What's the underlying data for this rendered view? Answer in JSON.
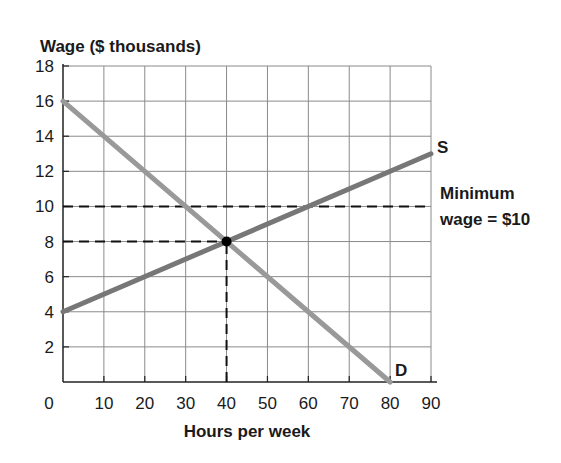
{
  "chart_data": {
    "type": "line",
    "title": "",
    "ylabel": "Wage ($ thousands)",
    "xlabel": "Hours per week",
    "xlim": [
      0,
      90
    ],
    "ylim": [
      0,
      18
    ],
    "x_ticks": [
      0,
      10,
      20,
      30,
      40,
      50,
      60,
      70,
      80,
      90
    ],
    "y_ticks": [
      2,
      4,
      6,
      8,
      10,
      12,
      14,
      16,
      18
    ],
    "grid": true,
    "series": [
      {
        "name": "S",
        "label": "S",
        "color": "#777777",
        "points": [
          [
            0,
            4
          ],
          [
            90,
            13
          ]
        ]
      },
      {
        "name": "D",
        "label": "D",
        "color": "#999999",
        "points": [
          [
            0,
            16
          ],
          [
            80,
            0
          ]
        ]
      }
    ],
    "equilibrium": {
      "x": 40,
      "y": 8
    },
    "reference_lines": [
      {
        "type": "horizontal",
        "y": 10,
        "style": "dashed",
        "label": "Minimum wage = $10"
      },
      {
        "type": "horizontal",
        "y": 8,
        "x_to": 40,
        "style": "dashed"
      },
      {
        "type": "vertical",
        "x": 40,
        "y_to": 8,
        "style": "dashed"
      }
    ],
    "annotations": [
      "Minimum",
      "wage = $10"
    ]
  },
  "labels": {
    "y_axis_title": "Wage ($ thousands)",
    "x_axis_title": "Hours per week",
    "supply": "S",
    "demand": "D",
    "min_wage_line1": "Minimum",
    "min_wage_line2": "wage = $10",
    "x_ticks": [
      "0",
      "10",
      "20",
      "30",
      "40",
      "50",
      "60",
      "70",
      "80",
      "90"
    ],
    "y_ticks": [
      "2",
      "4",
      "6",
      "8",
      "10",
      "12",
      "14",
      "16",
      "18"
    ]
  }
}
